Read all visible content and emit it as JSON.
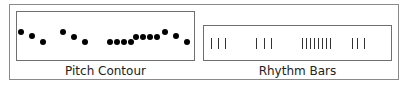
{
  "pitch_contour": {
    "label": "Pitch Contour",
    "dots_y": [
      32,
      36,
      42,
      32,
      37,
      42,
      42,
      42,
      42,
      42,
      37,
      37,
      37,
      37,
      32,
      36,
      42
    ],
    "dots_x": [
      21,
      32,
      43,
      63,
      74,
      85,
      110,
      117,
      124,
      131,
      136,
      143,
      150,
      157,
      165,
      176,
      187
    ]
  },
  "rhythm_bars": {
    "label": "Rhythm Bars",
    "bars_x": [
      211,
      218,
      225,
      256,
      264,
      271,
      302,
      306,
      310,
      314,
      318,
      322,
      326,
      330,
      352,
      357,
      364
    ]
  }
}
